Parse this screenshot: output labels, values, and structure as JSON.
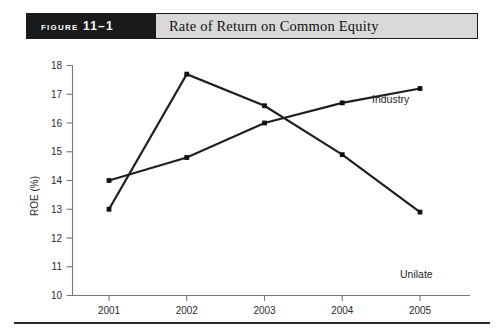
{
  "figure": {
    "number_label": "Figure 11–1",
    "caption": "Rate of Return on Common Equity"
  },
  "chart_data": {
    "type": "line",
    "title": "Rate of Return on Common Equity",
    "xlabel": "",
    "ylabel": "ROE (%)",
    "categories": [
      "2001",
      "2002",
      "2003",
      "2004",
      "2005"
    ],
    "x": [
      2001,
      2002,
      2003,
      2004,
      2005
    ],
    "ylim": [
      10,
      18
    ],
    "xlim": [
      2000.6,
      2005.6
    ],
    "yticks": [
      10,
      11,
      12,
      13,
      14,
      15,
      16,
      17,
      18
    ],
    "ytick_labels": [
      "10",
      "11",
      "12",
      "13",
      "14",
      "15",
      "16",
      "17",
      "18"
    ],
    "xtick_labels": [
      "2001",
      "2002",
      "2003",
      "2004",
      "2005"
    ],
    "grid": false,
    "legend": "inline-annotations",
    "series": [
      {
        "name": "Industry",
        "values": [
          14.0,
          14.8,
          16.0,
          16.7,
          17.2
        ],
        "color": "#1f1f1f",
        "label_text": "Industry"
      },
      {
        "name": "Unilate",
        "values": [
          13.0,
          17.7,
          16.6,
          14.9,
          12.9
        ],
        "color": "#1f1f1f",
        "label_text": "Unilate"
      }
    ],
    "annotations": [
      {
        "text": "Industry",
        "series": "Industry",
        "near_year": 2005
      },
      {
        "text": "Unilate",
        "series": "Unilate",
        "near_year": 2005
      }
    ]
  },
  "axes": {
    "y_axis_title": "ROE (%)",
    "y_tick_0": "10",
    "y_tick_1": "11",
    "y_tick_2": "12",
    "y_tick_3": "13",
    "y_tick_4": "14",
    "y_tick_5": "15",
    "y_tick_6": "16",
    "y_tick_7": "17",
    "y_tick_8": "18",
    "x_tick_0": "2001",
    "x_tick_1": "2002",
    "x_tick_2": "2003",
    "x_tick_3": "2004",
    "x_tick_4": "2005"
  },
  "series_labels": {
    "industry": "Industry",
    "unilate": "Unilate"
  },
  "colors": {
    "caption_bar_dark": "#1a1a1a",
    "caption_bar_gray": "#d9d9d9",
    "line": "#1f1f1f",
    "axis": "#777777",
    "rule": "#2e2e2e"
  }
}
